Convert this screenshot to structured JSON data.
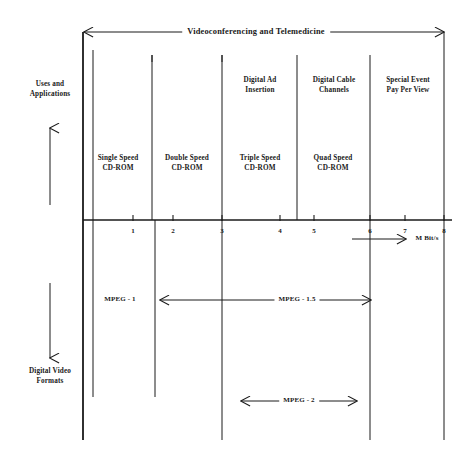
{
  "diagram": {
    "title_arrow": {
      "label": "Videoconferencing and Telemedicine",
      "x1": 84,
      "x2": 444,
      "y": 32
    },
    "axis": {
      "units_label": "M Bit/s",
      "y": 220,
      "x_start": 83,
      "x_end": 452,
      "origin_x": 93,
      "px_per_unit": 40.1,
      "ticks": [
        {
          "value": "1",
          "x": 133
        },
        {
          "value": "2",
          "x": 173
        },
        {
          "value": "3",
          "x": 222
        },
        {
          "value": "4",
          "x": 280
        },
        {
          "value": "5",
          "x": 314
        },
        {
          "value": "6",
          "x": 370
        },
        {
          "value": "7",
          "x": 405
        },
        {
          "value": "8",
          "x": 444
        }
      ],
      "units_arrow": {
        "x1": 352,
        "x2": 406,
        "y": 239,
        "label_x": 427
      }
    },
    "side_labels": [
      {
        "name": "uses-and-applications",
        "text": "Uses and\nApplications",
        "x": 50,
        "y": 89,
        "arrow": {
          "x": 50,
          "y_from": 205,
          "y_to": 128,
          "direction": "up"
        }
      },
      {
        "name": "digital-video-formats",
        "text": "Digital Video\nFormats",
        "x": 50,
        "y": 376,
        "arrow": {
          "x": 50,
          "y_from": 283,
          "y_to": 358,
          "direction": "down"
        }
      }
    ],
    "upper_band_labels": [
      {
        "name": "single-speed-cdrom",
        "text": "Single Speed\nCD-ROM",
        "x": 118,
        "y": 163
      },
      {
        "name": "double-speed-cdrom",
        "text": "Double  Speed\nCD-ROM",
        "x": 187,
        "y": 163
      },
      {
        "name": "triple-speed-cdrom",
        "text": "Triple Speed\nCD-ROM",
        "x": 260,
        "y": 163
      },
      {
        "name": "quad-speed-cdrom",
        "text": "Quad Speed\nCD-ROM",
        "x": 333,
        "y": 163
      },
      {
        "name": "digital-ad-insertion",
        "text": "Digital Ad\nInsertion",
        "x": 260,
        "y": 85
      },
      {
        "name": "digital-cable-channels",
        "text": "Digital Cable\nChannels",
        "x": 334,
        "y": 85
      },
      {
        "name": "special-event-pay-per-view",
        "text": "Special Event\nPay Per View",
        "x": 408,
        "y": 85
      }
    ],
    "lower_labels": [
      {
        "name": "mpeg-1",
        "text": "MPEG - 1",
        "x": 120,
        "y": 300
      }
    ],
    "lower_arrows": [
      {
        "name": "mpeg-1-5-arrow",
        "label": "MPEG - 1.5",
        "x1": 160,
        "x2": 371,
        "y": 300,
        "label_x": 297
      },
      {
        "name": "mpeg-2-arrow",
        "label": "MPEG - 2",
        "x1": 241,
        "x2": 357,
        "y": 401,
        "label_x": 299
      }
    ],
    "vertical_dividers": [
      {
        "name": "divider-frame-outer",
        "x": 83,
        "y1": 32,
        "y2": 440,
        "w": 1.8
      },
      {
        "name": "divider-frame-inner",
        "x": 93,
        "y1": 50,
        "y2": 397,
        "w": 1.0
      },
      {
        "name": "divider-1-2",
        "x": 152,
        "y1": 55,
        "y2": 220,
        "w": 1.0
      },
      {
        "name": "divider-1-2-lower",
        "x": 155,
        "y1": 220,
        "y2": 397,
        "w": 1.0
      },
      {
        "name": "divider-3",
        "x": 222,
        "y1": 55,
        "y2": 440,
        "w": 1.0
      },
      {
        "name": "divider-4-6",
        "x": 297,
        "y1": 55,
        "y2": 220,
        "w": 1.0
      },
      {
        "name": "divider-6",
        "x": 370,
        "y1": 55,
        "y2": 440,
        "w": 1.0
      },
      {
        "name": "divider-8",
        "x": 444,
        "y1": 32,
        "y2": 440,
        "w": 1.0
      }
    ],
    "short_top_dividers": [
      {
        "name": "short-divider-a",
        "x": 152,
        "y1": 55,
        "y2": 62
      },
      {
        "name": "short-divider-b",
        "x": 222,
        "y1": 55,
        "y2": 62
      }
    ],
    "colors": {
      "ink": "#1a1a1a",
      "background": "#ffffff"
    }
  }
}
